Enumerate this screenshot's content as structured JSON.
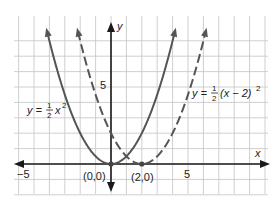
{
  "chart_data": {
    "type": "line",
    "title": "",
    "xlabel": "x",
    "ylabel": "y",
    "xlim": [
      -6,
      10
    ],
    "ylim": [
      -1.5,
      8.5
    ],
    "grid": true,
    "tick_labels": {
      "x": [
        "-5",
        "5"
      ],
      "y": [
        "5"
      ]
    },
    "series": [
      {
        "name": "y = 1/2 x^2",
        "style": "solid",
        "color": "#555555",
        "equation": "y = 0.5*x^2",
        "vertex": [
          0,
          0
        ],
        "x": [
          -4,
          -3,
          -2,
          -1,
          0,
          1,
          2,
          3,
          4
        ],
        "y": [
          8,
          4.5,
          2,
          0.5,
          0,
          0.5,
          2,
          4.5,
          8
        ]
      },
      {
        "name": "y = 1/2 (x-2)^2",
        "style": "dashed",
        "color": "#555555",
        "equation": "y = 0.5*(x-2)^2",
        "vertex": [
          2,
          0
        ],
        "x": [
          -2,
          -1,
          0,
          1,
          2,
          3,
          4,
          5,
          6
        ],
        "y": [
          8,
          4.5,
          2,
          0.5,
          0,
          0.5,
          2,
          4.5,
          8
        ]
      }
    ],
    "annotations": [
      {
        "text": "(0,0)",
        "at": [
          0,
          0
        ]
      },
      {
        "text": "(2,0)",
        "at": [
          2,
          0
        ]
      },
      {
        "text": "y = 1/2 x²",
        "near_series": 0
      },
      {
        "text": "y = 1/2 (x − 2)²",
        "near_series": 1
      }
    ]
  },
  "labels": {
    "x_axis": "x",
    "y_axis": "y",
    "tick_x_neg5": "−5",
    "tick_x_5": "5",
    "tick_y_5": "5",
    "point_origin": "(0,0)",
    "point_vertex2": "(2,0)",
    "eq1_prefix": "y = ",
    "eq1_num": "1",
    "eq1_den": "2",
    "eq1_var": "x",
    "eq1_exp": "2",
    "eq2_prefix": "y = ",
    "eq2_num": "1",
    "eq2_den": "2",
    "eq2_body": "(x − 2)",
    "eq2_exp": "2"
  }
}
